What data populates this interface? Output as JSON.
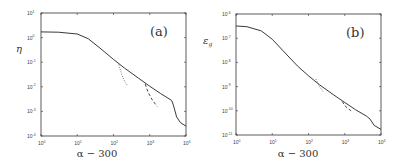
{
  "chart_data": [
    {
      "type": "line",
      "panel_label": "(a)",
      "xlabel": "α − 300",
      "ylabel": "η",
      "xscale": "log",
      "yscale": "log",
      "xlim": [
        1,
        10000
      ],
      "ylim": [
        0.0001,
        10
      ],
      "x_ticks": [
        "10^0",
        "10^1",
        "10^2",
        "10^3",
        "10^4"
      ],
      "y_ticks": [
        "10^1",
        "10^0",
        "10^-1",
        "10^-2",
        "10^-3",
        "10^-4"
      ],
      "grid": false,
      "series": [
        {
          "name": "solid",
          "style": "solid",
          "x": [
            1,
            3,
            10,
            20,
            40,
            100,
            200,
            500,
            1000,
            2000,
            4000,
            4500,
            5500,
            7000,
            10000
          ],
          "y": [
            1.7,
            1.65,
            1.4,
            0.9,
            0.4,
            0.13,
            0.058,
            0.022,
            0.0105,
            0.0053,
            0.0028,
            0.0018,
            0.0006,
            0.00035,
            0.00025
          ]
        },
        {
          "name": "dotted",
          "style": "dotted",
          "x": [
            140,
            170,
            210,
            260
          ],
          "y": [
            0.08,
            0.03,
            0.015,
            0.0105
          ]
        },
        {
          "name": "dashed",
          "style": "dashed",
          "x": [
            750,
            900,
            1200,
            1600
          ],
          "y": [
            0.013,
            0.006,
            0.0028,
            0.0016
          ]
        }
      ]
    },
    {
      "type": "line",
      "panel_label": "(b)",
      "xlabel": "α − 300",
      "ylabel": "ε_g",
      "xscale": "log",
      "yscale": "log",
      "xlim": [
        1,
        10000
      ],
      "ylim": [
        1e-11,
        1e-06
      ],
      "x_ticks": [
        "10^0",
        "10^1",
        "10^2",
        "10^3",
        "10^4"
      ],
      "y_ticks": [
        "10^-6",
        "10^-7",
        "10^-8",
        "10^-9",
        "10^-10",
        "10^-11"
      ],
      "grid": false,
      "series": [
        {
          "name": "solid",
          "style": "solid",
          "x": [
            1,
            2,
            5,
            10,
            20,
            50,
            100,
            200,
            500,
            1000,
            2000,
            4000,
            5000,
            6500,
            10000
          ],
          "y": [
            3.2e-07,
            3e-07,
            2e-07,
            9e-08,
            3e-08,
            7e-09,
            2.8e-09,
            1.2e-09,
            4.5e-10,
            2.2e-10,
            1.1e-10,
            6e-11,
            4.5e-11,
            2.5e-11,
            1.7e-11
          ]
        },
        {
          "name": "dotted",
          "style": "dotted",
          "x": [
            160,
            200,
            260
          ],
          "y": [
            2e-09,
            1e-09,
            6e-10
          ]
        },
        {
          "name": "dashed",
          "style": "dashed",
          "x": [
            850,
            1100,
            1500
          ],
          "y": [
            2.4e-10,
            1.4e-10,
            1e-10
          ]
        }
      ]
    }
  ],
  "panels": [
    {
      "label": "(a)",
      "ylabel": "η",
      "xlabel": "α − 300",
      "y_ticks": [
        {
          "b": "10",
          "e": "1"
        },
        {
          "b": "10",
          "e": "0"
        },
        {
          "b": "10",
          "e": "-1"
        },
        {
          "b": "10",
          "e": "-2"
        },
        {
          "b": "10",
          "e": "-3"
        },
        {
          "b": "10",
          "e": "-4"
        }
      ],
      "x_ticks": [
        {
          "b": "10",
          "e": "0"
        },
        {
          "b": "10",
          "e": "1"
        },
        {
          "b": "10",
          "e": "2"
        },
        {
          "b": "10",
          "e": "3"
        },
        {
          "b": "10",
          "e": "4"
        }
      ]
    },
    {
      "label": "(b)",
      "ylabel": "ε",
      "ylabel_sub": "g",
      "xlabel": "α − 300",
      "y_ticks": [
        {
          "b": "10",
          "e": "-6"
        },
        {
          "b": "10",
          "e": "-7"
        },
        {
          "b": "10",
          "e": "-8"
        },
        {
          "b": "10",
          "e": "-9"
        },
        {
          "b": "10",
          "e": "-10"
        },
        {
          "b": "10",
          "e": "-11"
        }
      ],
      "x_ticks": [
        {
          "b": "10",
          "e": "0"
        },
        {
          "b": "10",
          "e": "1"
        },
        {
          "b": "10",
          "e": "2"
        },
        {
          "b": "10",
          "e": "3"
        },
        {
          "b": "10",
          "e": "4"
        }
      ]
    }
  ]
}
